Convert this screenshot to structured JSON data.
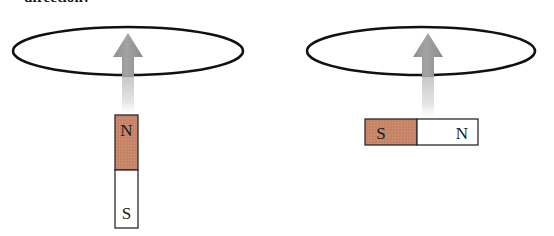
{
  "figure": {
    "caption_clipped": "direction?",
    "background_color": "#ffffff",
    "width": 554,
    "height": 236
  },
  "colors": {
    "loop_stroke": "#111111",
    "arrow_fill": "#9a9a9a",
    "arrow_tail": "#d8d8d8",
    "pole_shaded": "#c8866a",
    "pole_plain": "#ffffff",
    "magnet_outline": "#2a2a2a",
    "label_text": "#1a1a1a"
  },
  "panels": [
    {
      "id": "left-panel",
      "name": "vertical-magnet-scenario",
      "loop": {
        "name": "wire-loop",
        "cx": 128,
        "cy": 51,
        "rx": 115,
        "ry": 24,
        "stroke_width": 2.6
      },
      "arrow": {
        "name": "motion-arrow",
        "direction": "up",
        "tip_x": 128,
        "tip_y": 33,
        "head_half_width": 15,
        "head_height": 24,
        "shaft_half_width": 6,
        "shaft_bottom_y": 75,
        "tail_bottom_y": 115
      },
      "magnet": {
        "name": "bar-magnet",
        "orientation": "vertical",
        "x": 115,
        "y": 115,
        "width": 23,
        "height": 113,
        "poles": [
          {
            "label": "N",
            "shaded": true,
            "span_fraction": 0.49
          },
          {
            "label": "S",
            "shaded": false,
            "span_fraction": 0.51
          }
        ]
      }
    },
    {
      "id": "right-panel",
      "name": "horizontal-magnet-scenario",
      "loop": {
        "name": "wire-loop",
        "cx": 421,
        "cy": 51,
        "rx": 114,
        "ry": 24,
        "stroke_width": 2.6
      },
      "arrow": {
        "name": "motion-arrow",
        "direction": "up",
        "tip_x": 428,
        "tip_y": 33,
        "head_half_width": 15,
        "head_height": 24,
        "shaft_half_width": 6,
        "shaft_bottom_y": 75,
        "tail_bottom_y": 120
      },
      "magnet": {
        "name": "bar-magnet",
        "orientation": "horizontal",
        "x": 365,
        "y": 119,
        "width": 113,
        "height": 26,
        "poles": [
          {
            "label": "S",
            "shaded": true,
            "span_fraction": 0.46
          },
          {
            "label": "N",
            "shaded": false,
            "span_fraction": 0.54
          }
        ]
      }
    }
  ],
  "labels": {
    "left_magnet_top_pole": "N",
    "left_magnet_bottom_pole": "S",
    "right_magnet_left_pole": "S",
    "right_magnet_right_pole": "N"
  }
}
